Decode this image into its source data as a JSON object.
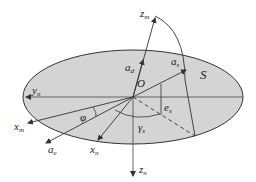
{
  "diagram": {
    "plane_label": "S",
    "origin_label": "O",
    "axes": {
      "zm": {
        "base": "z",
        "sub": "m"
      },
      "zn": {
        "base": "z",
        "sub": "n"
      },
      "yn": {
        "base": "y",
        "sub": "n"
      },
      "xm": {
        "base": "x",
        "sub": "m"
      },
      "xn": {
        "base": "x",
        "sub": "n"
      }
    },
    "vectors": {
      "ad": {
        "base": "a",
        "sub": "d"
      },
      "as": {
        "base": "a",
        "sub": "s"
      },
      "ae": {
        "base": "a",
        "sub": "e"
      }
    },
    "angles": {
      "phi": {
        "base": "φ",
        "sub": ""
      },
      "es": {
        "base": "e",
        "sub": "s"
      },
      "gamma": {
        "base": "γ",
        "sub": "s"
      }
    },
    "colors": {
      "plane_fill": "#d4d4d4",
      "stroke": "#333333"
    }
  }
}
